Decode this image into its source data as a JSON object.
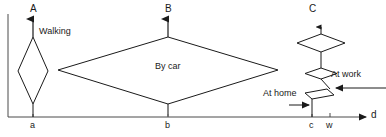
{
  "figure": {
    "title": "",
    "type": "space-time diagram",
    "background_color": "#ffffff",
    "line_color": "#1a1a1a",
    "text_color": "#1a1a1a"
  },
  "axes": {
    "x_axis": {
      "name": "horizontal-distance-axis",
      "label": "d",
      "label_x": 373,
      "label_y": 112,
      "start_x": 8,
      "end_x": 366,
      "y": 117
    },
    "y_axis": {
      "name": "vertical-time-axis",
      "label": "",
      "x": 8,
      "start_y": 14,
      "end_y": 117
    },
    "ticks": [
      {
        "id": "tick-a",
        "label": "a",
        "x": 33,
        "label_x": 30,
        "label_y": 122
      },
      {
        "id": "tick-b",
        "label": "b",
        "x": 168,
        "label_x": 165,
        "label_y": 122
      },
      {
        "id": "tick-c",
        "label": "c",
        "x": 312,
        "label_x": 309,
        "label_y": 122
      },
      {
        "id": "tick-w",
        "label": "w",
        "x": 330,
        "label_x": 326,
        "label_y": 122
      }
    ]
  },
  "trajectories": [
    {
      "id": "A",
      "label": "A",
      "label_x": 30,
      "label_y": 6,
      "mode_label": "Walking",
      "mode_label_x": 39,
      "mode_label_y": 30,
      "base_x": 33,
      "arrow_tip_y": 17,
      "diamond": {
        "top_y": 37,
        "bottom_y": 104,
        "left_x": 18,
        "right_x": 48,
        "mid_y": 71
      }
    },
    {
      "id": "B",
      "label": "B",
      "label_x": 165,
      "label_y": 6,
      "mode_label": "By car",
      "mode_label_x": 155,
      "mode_label_y": 64,
      "base_x": 168,
      "arrow_tip_y": 17,
      "diamond": {
        "top_y": 37,
        "bottom_y": 104,
        "left_x": 58,
        "right_x": 278,
        "mid_y": 70
      }
    },
    {
      "id": "C",
      "label": "C",
      "label_x": 309,
      "label_y": 6,
      "mode_label": "",
      "base_x": 312,
      "arrow_tip_y": 30,
      "top_diamond": {
        "top_y": 34,
        "bottom_y": 52,
        "left_x": 297,
        "right_x": 345,
        "center_x": 321
      },
      "mid_diamond": {
        "top_y": 68,
        "bottom_y": 79,
        "left_x": 305,
        "right_x": 337,
        "center_x": 321
      },
      "low_sliver": {
        "top_y": 89,
        "bottom_y": 99,
        "left_x": 305,
        "right_x": 334
      }
    }
  ],
  "annotations": [
    {
      "id": "at-home",
      "text": "At home",
      "text_x": 263,
      "text_y": 90,
      "arrow_from_x": 289,
      "arrow_to_x": 311,
      "arrow_y": 105,
      "direction": "right"
    },
    {
      "id": "at-work",
      "text": "At work",
      "text_x": 331,
      "text_y": 71,
      "arrow_from_x": 386,
      "arrow_to_x": 333,
      "arrow_y": 88,
      "direction": "left"
    }
  ]
}
